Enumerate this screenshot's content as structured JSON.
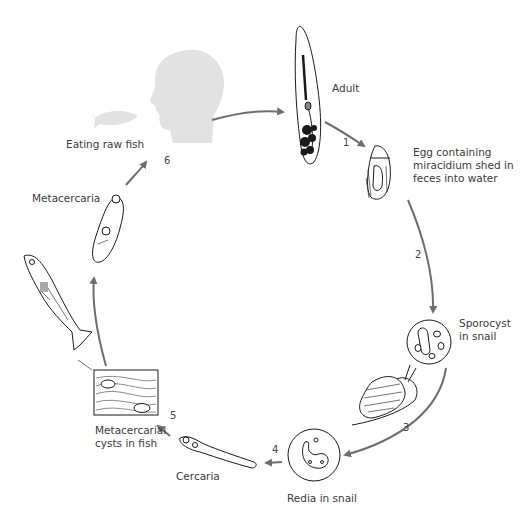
{
  "diagram": {
    "stages": [
      {
        "id": "adult",
        "label": "Adult",
        "step": "1"
      },
      {
        "id": "egg",
        "label": "Egg containing\nmiracidium shed in\nfeces into water",
        "step": "2"
      },
      {
        "id": "sporocyst",
        "label": "Sporocyst\nin snail",
        "step": "3"
      },
      {
        "id": "redia",
        "label": "Redia in snail",
        "step": "4"
      },
      {
        "id": "cercaria",
        "label": "Cercaria",
        "step": ""
      },
      {
        "id": "cysts",
        "label": "Metacercarial\ncysts in fish",
        "step": "5"
      },
      {
        "id": "metacercaria",
        "label": "Metacercaria",
        "step": ""
      },
      {
        "id": "eating",
        "label": "Eating raw fish",
        "step": "6"
      }
    ],
    "colors": {
      "arrow": "#6e6e6e",
      "silhouette": "#e2e2e2",
      "ink": "#1a1a1a",
      "text": "#3a3a3a"
    }
  }
}
